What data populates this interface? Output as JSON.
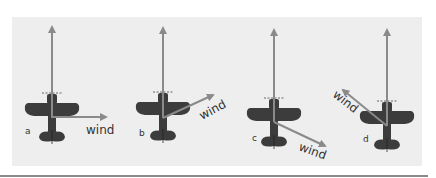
{
  "diagram": {
    "colors": {
      "background": "#eeeeee",
      "airplane": "#3c3c3c",
      "arrow": "#8a8a8a",
      "text": "#333333"
    },
    "heading_arrow_label": "",
    "panels": [
      {
        "id": "a",
        "label": "a",
        "wind_label": "wind",
        "wind_direction": "right (90° to heading)"
      },
      {
        "id": "b",
        "label": "b",
        "wind_label": "wind",
        "wind_direction": "forward-right (~30° above horizontal)"
      },
      {
        "id": "c",
        "label": "c",
        "wind_label": "wind",
        "wind_direction": "backward-right (~30° below horizontal)"
      },
      {
        "id": "d",
        "label": "d",
        "wind_label": "wind",
        "wind_direction": "forward-left (~35° above horizontal)"
      }
    ]
  }
}
